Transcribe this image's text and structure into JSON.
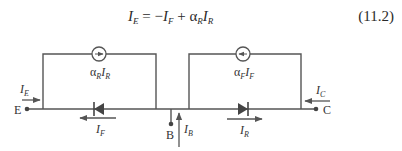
{
  "equation": {
    "lhs": "I",
    "lhs_sub": "E",
    "eq": " = −",
    "t1": "I",
    "t1_sub": "F",
    "plus": " + ",
    "alpha": "α",
    "alpha_sub": "R",
    "t2": "I",
    "t2_sub": "R",
    "number": "(11.2)"
  },
  "circuit": {
    "stroke_color": "#555555",
    "terminals": {
      "emitter": "E",
      "base": "B",
      "collector": "C"
    },
    "currents": {
      "emitter": {
        "sym": "I",
        "sub": "E"
      },
      "base": {
        "sym": "I",
        "sub": "B"
      },
      "collector": {
        "sym": "I",
        "sub": "C"
      },
      "forward": {
        "sym": "I",
        "sub": "F"
      },
      "reverse": {
        "sym": "I",
        "sub": "R"
      }
    },
    "sources": {
      "left": {
        "alpha": "α",
        "alpha_sub": "R",
        "sym": "I",
        "sub": "R",
        "direction": "right"
      },
      "right": {
        "alpha": "α",
        "alpha_sub": "F",
        "sym": "I",
        "sub": "F",
        "direction": "left"
      }
    },
    "diodes": {
      "left": {
        "direction": "left"
      },
      "right": {
        "direction": "right"
      }
    }
  }
}
